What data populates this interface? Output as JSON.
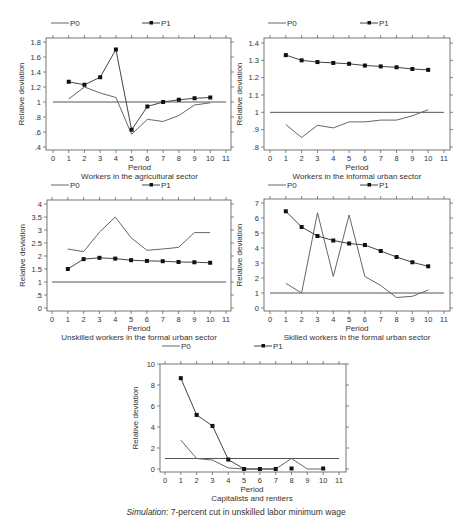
{
  "figure": {
    "caption_italic": "Simulation",
    "caption_rest": ": 7-percent cut in unskilled labor minimum wage"
  },
  "legend": {
    "p0_label": "P0",
    "p1_label": "P1"
  },
  "colors": {
    "p0": "#666666",
    "p1": "#444444",
    "marker": "#111111",
    "reference": "#555555"
  },
  "chart_data": [
    {
      "type": "line",
      "title": "Workers in the agricultural sector",
      "xlabel": "Period",
      "ylabel": "Relative deviation",
      "x_ticks": [
        0,
        1,
        2,
        3,
        4,
        5,
        6,
        7,
        8,
        9,
        10,
        11
      ],
      "y_ticks": [
        0.4,
        0.6,
        0.8,
        1,
        1.2,
        1.4,
        1.6,
        1.8
      ],
      "y_tick_labels": [
        ".4",
        ".6",
        ".8",
        "1",
        "1.2",
        "1.4",
        "1.6",
        "1.8"
      ],
      "xlim": [
        0,
        11
      ],
      "ylim": [
        0.4,
        1.8
      ],
      "reference_line": 1.0,
      "legend_position": "top",
      "grid": false,
      "x": [
        1,
        2,
        3,
        4,
        5,
        6,
        7,
        8,
        9,
        10
      ],
      "series": [
        {
          "name": "P0",
          "markers": false,
          "values": [
            1.04,
            1.2,
            1.12,
            1.06,
            0.57,
            0.77,
            0.74,
            0.82,
            0.96,
            0.99
          ]
        },
        {
          "name": "P1",
          "markers": true,
          "values": [
            1.27,
            1.23,
            1.33,
            1.7,
            0.63,
            0.94,
            1.0,
            1.03,
            1.05,
            1.06
          ]
        }
      ],
      "layout": {
        "left": 46,
        "top": 38,
        "right": 231,
        "bottom": 150,
        "x0px": 53,
        "x11px": 226,
        "ytop": 1.8,
        "ytoppx": 42,
        "ybot": 0.4,
        "ybotpx": 147,
        "legend_y": 26,
        "p0x": 51,
        "p1x": 142
      }
    },
    {
      "type": "line",
      "title": "Workers in the informal urban sector",
      "xlabel": "Period",
      "ylabel": "Relative deviation",
      "x_ticks": [
        0,
        1,
        2,
        3,
        4,
        5,
        6,
        7,
        8,
        9,
        10,
        11
      ],
      "y_ticks": [
        0.8,
        0.9,
        1,
        1.1,
        1.2,
        1.3,
        1.4
      ],
      "y_tick_labels": [
        ".8",
        ".9",
        "1",
        "1.1",
        "1.2",
        "1.3",
        "1.4"
      ],
      "xlim": [
        0,
        11
      ],
      "ylim": [
        0.8,
        1.4
      ],
      "reference_line": 1.0,
      "legend_position": "top",
      "grid": false,
      "x": [
        1,
        2,
        3,
        4,
        5,
        6,
        7,
        8,
        9,
        10
      ],
      "series": [
        {
          "name": "P0",
          "markers": false,
          "values": [
            0.93,
            0.855,
            0.925,
            0.91,
            0.945,
            0.945,
            0.955,
            0.955,
            0.98,
            1.015
          ]
        },
        {
          "name": "P1",
          "markers": true,
          "values": [
            1.33,
            1.3,
            1.29,
            1.285,
            1.28,
            1.27,
            1.265,
            1.26,
            1.25,
            1.245
          ]
        }
      ],
      "layout": {
        "left": 264,
        "top": 38,
        "right": 450,
        "bottom": 150,
        "x0px": 270,
        "x11px": 444,
        "ytop": 1.4,
        "ytoppx": 43,
        "ybot": 0.8,
        "ybotpx": 147,
        "legend_y": 26,
        "p0x": 268,
        "p1x": 360
      }
    },
    {
      "type": "line",
      "title": "Unskilled workers in the formal urban sector",
      "xlabel": "Period",
      "ylabel": "Relative deviation",
      "x_ticks": [
        0,
        1,
        2,
        3,
        4,
        5,
        6,
        7,
        8,
        9,
        10,
        11
      ],
      "y_ticks": [
        0,
        0.5,
        1,
        1.5,
        2,
        2.5,
        3,
        3.5,
        4
      ],
      "y_tick_labels": [
        "0",
        ".5",
        "1",
        "1.5",
        "2",
        "2.5",
        "3",
        "3.5",
        "4"
      ],
      "xlim": [
        0,
        11
      ],
      "ylim": [
        0,
        4
      ],
      "reference_line": 1.0,
      "legend_position": "top",
      "grid": false,
      "x": [
        1,
        2,
        3,
        4,
        5,
        6,
        7,
        8,
        9,
        10
      ],
      "series": [
        {
          "name": "P0",
          "markers": false,
          "values": [
            2.27,
            2.17,
            2.92,
            3.5,
            2.7,
            2.22,
            2.27,
            2.33,
            2.9,
            2.9
          ]
        },
        {
          "name": "P1",
          "markers": true,
          "values": [
            1.5,
            1.88,
            1.93,
            1.9,
            1.84,
            1.81,
            1.8,
            1.77,
            1.76,
            1.74
          ]
        }
      ],
      "layout": {
        "left": 47,
        "top": 200,
        "right": 231,
        "bottom": 311,
        "x0px": 52,
        "x11px": 226,
        "ytop": 4,
        "ytoppx": 204,
        "ybot": 0,
        "ybotpx": 308,
        "legend_y": 188,
        "p0x": 51,
        "p1x": 142
      }
    },
    {
      "type": "line",
      "title": "Skilled workers in the formal urban sector",
      "xlabel": "Period",
      "ylabel": "Relative deviation",
      "x_ticks": [
        0,
        1,
        2,
        3,
        4,
        5,
        6,
        7,
        8,
        9,
        10,
        11
      ],
      "y_ticks": [
        0,
        1,
        2,
        3,
        4,
        5,
        6,
        7
      ],
      "y_tick_labels": [
        "0",
        "1",
        "2",
        "3",
        "4",
        "5",
        "6",
        "7"
      ],
      "xlim": [
        0,
        11
      ],
      "ylim": [
        0,
        7
      ],
      "reference_line": 1.0,
      "legend_position": "top",
      "grid": false,
      "x": [
        1,
        2,
        3,
        4,
        5,
        6,
        7,
        8,
        9,
        10
      ],
      "series": [
        {
          "name": "P0",
          "markers": false,
          "values": [
            1.65,
            1.0,
            6.35,
            2.1,
            6.2,
            2.1,
            1.5,
            0.7,
            0.78,
            1.2
          ]
        },
        {
          "name": "P1",
          "markers": true,
          "values": [
            6.45,
            5.4,
            4.8,
            4.5,
            4.3,
            4.2,
            3.8,
            3.4,
            3.05,
            2.78
          ]
        }
      ],
      "layout": {
        "left": 264,
        "top": 199,
        "right": 450,
        "bottom": 311,
        "x0px": 270,
        "x11px": 444,
        "ytop": 7,
        "ytoppx": 203,
        "ybot": 0,
        "ybotpx": 308,
        "legend_y": 188,
        "p0x": 268,
        "p1x": 360
      }
    },
    {
      "type": "line",
      "title": "Capitalists and rentiers",
      "xlabel": "Period",
      "ylabel": "Relative deviation",
      "x_ticks": [
        0,
        1,
        2,
        3,
        4,
        5,
        6,
        7,
        8,
        9,
        10,
        11
      ],
      "y_ticks": [
        0,
        2,
        4,
        6,
        8,
        10
      ],
      "y_tick_labels": [
        "0",
        "2",
        "4",
        "6",
        "8",
        "10"
      ],
      "xlim": [
        0,
        11
      ],
      "ylim": [
        0,
        10
      ],
      "reference_line": 1.0,
      "legend_position": "top",
      "grid": false,
      "x": [
        1,
        2,
        3,
        4,
        5,
        6,
        7,
        8,
        9,
        10
      ],
      "series": [
        {
          "name": "P0",
          "markers": false,
          "values": [
            2.75,
            1.0,
            0.85,
            0.1,
            0.0,
            0.0,
            0.0,
            1.0,
            0.0,
            0.0
          ]
        },
        {
          "name": "P1",
          "markers": true,
          "values": [
            8.65,
            5.15,
            4.1,
            0.9,
            0.0,
            0.0,
            0.0,
            0.05,
            null,
            0.05
          ],
          "connected_segments": [
            [
              1,
              7
            ]
          ]
        }
      ],
      "layout": {
        "left": 160,
        "top": 364,
        "right": 346,
        "bottom": 472,
        "x0px": 165,
        "x11px": 339,
        "ytop": 10,
        "ytoppx": 364,
        "ybot": 0,
        "ybotpx": 469,
        "legend_y": 349,
        "p0x": 162,
        "p1x": 254
      }
    }
  ]
}
